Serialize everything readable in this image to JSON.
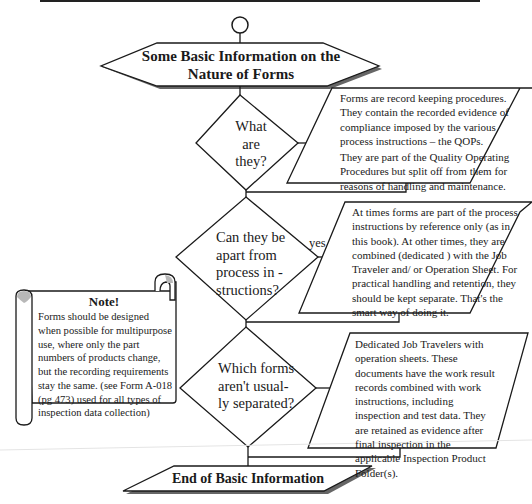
{
  "diagram": {
    "type": "flowchart",
    "start": {
      "shape": "circle",
      "label": ""
    },
    "header": {
      "shape": "hexagon",
      "line1": "Some Basic Information on the",
      "line2": "Nature of Forms"
    },
    "steps": [
      {
        "question": {
          "shape": "diamond",
          "lines": [
            "What",
            "are",
            "they?"
          ]
        },
        "edge_label": "",
        "answer": {
          "shape": "parallelogram",
          "para1": "Forms are record keeping procedures. They contain the recorded evidence of compliance imposed by the various process instructions –  the QOPs.",
          "para2": "They are part of the Quality Operating Procedures but split off from them for reasons of handling and maintenance."
        }
      },
      {
        "question": {
          "shape": "diamond",
          "lines": [
            "Can they be",
            "apart from",
            "process in -",
            "structions?"
          ]
        },
        "edge_label": "yes",
        "answer": {
          "shape": "parallelogram",
          "para1": "At times forms are part of the process instructions by reference only (as in this book). At other times, they are combined (dedicated ) with the Job Traveler and/ or Operation Sheet. For practical handling and retention, they should be kept separate. That's the smart way of doing it."
        }
      },
      {
        "question": {
          "shape": "diamond",
          "lines": [
            "Which forms",
            "aren't usual-",
            "ly separated?"
          ]
        },
        "edge_label": "",
        "answer": {
          "shape": "parallelogram",
          "para1": "Dedicated Job Travelers with operation sheets. These documents have the work result records combined with work instructions, including inspection and test data. They are retained as evidence after final inspection in the applicable Inspection Product Folder(s)."
        }
      }
    ],
    "end": {
      "shape": "parallelogram",
      "label": "End of Basic Information"
    },
    "note": {
      "shape": "scroll",
      "title": "Note!",
      "text": "Forms should be designed when possible for multipurpose use, where only the part numbers of products change, but the recording requirements stay the same. (see Form A-018 (pg 473) used for all types of inspection data collection)"
    },
    "colors": {
      "stroke": "#1a1a1a",
      "shadow": "#555555",
      "fill": "#ffffff",
      "scroll_curl": "#b8b8b8"
    }
  }
}
